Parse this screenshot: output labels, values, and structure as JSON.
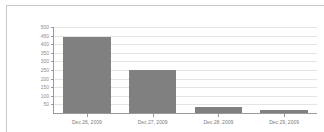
{
  "chart_data": {
    "type": "bar",
    "title": "",
    "subtitle": "",
    "xlabel": "",
    "ylabel": "",
    "categories": [
      "Dec 26, 2009",
      "Dec 27, 2009",
      "Dec 28, 2009",
      "Dec 29, 2009"
    ],
    "values": [
      440,
      250,
      35,
      15
    ],
    "ylim": [
      0,
      500
    ],
    "y_ticks": [
      50,
      100,
      150,
      200,
      250,
      300,
      350,
      400,
      450,
      500
    ],
    "y_tick_labels": [
      "50",
      "100",
      "150",
      "200",
      "250",
      "300",
      "350",
      "400",
      "450",
      "500"
    ],
    "grid": true,
    "legend": false,
    "legend_position": "none",
    "bar_color": "#808080",
    "grid_color": "#e4e4e4",
    "axis_color": "#9a9a9a",
    "tick_label_color": "#8d8d8d",
    "background_color": "#ffffff",
    "frame_color": "#c9c9c9"
  }
}
